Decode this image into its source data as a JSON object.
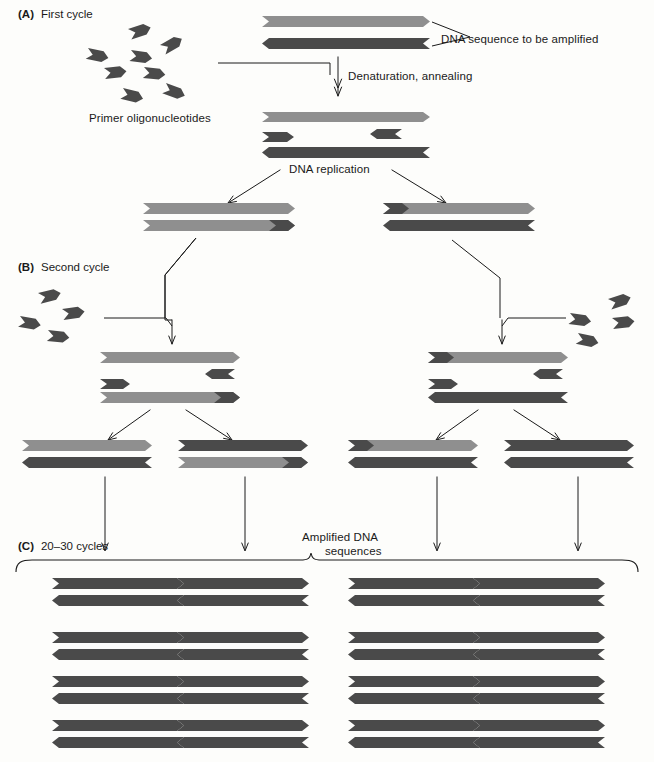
{
  "figure": {
    "type": "diagram"
  },
  "sections": [
    {
      "id": "A",
      "tag": "(A)",
      "label": "First cycle",
      "x": 18,
      "y": 8
    },
    {
      "id": "B",
      "tag": "(B)",
      "label": "Second cycle",
      "x": 18,
      "y": 261
    },
    {
      "id": "C",
      "tag": "(C)",
      "label": "20–30 cycles",
      "x": 18,
      "y": 540
    }
  ],
  "annotations": [
    {
      "name": "dna-sequence-callout",
      "text": "DNA sequence to be amplified",
      "x": 441,
      "y": 33,
      "align": "left"
    },
    {
      "name": "denaturation-annealing-label",
      "text": "Denaturation, annealing",
      "x": 348,
      "y": 70,
      "align": "left"
    },
    {
      "name": "primer-oligonucleotides-label",
      "text": "Primer oligonucleotides",
      "x": 89,
      "y": 112,
      "align": "left"
    },
    {
      "name": "dna-replication-label",
      "text": "DNA replication",
      "x": 289,
      "y": 163,
      "align": "left"
    },
    {
      "name": "amplified-dna-label-line1",
      "text": "Amplified DNA",
      "x": 302,
      "y": 531,
      "align": "left"
    },
    {
      "name": "amplified-dna-label-line2",
      "text": "sequences",
      "x": 325,
      "y": 544,
      "align": "left"
    }
  ],
  "colors": {
    "strand_light": "#8f8f8f",
    "strand_dark": "#4a4a4a",
    "strand_mid": "#9a9a9a",
    "primer": "#4a4a4a",
    "line": "#1a1a1a",
    "text": "#1a1a1a",
    "background": "#fdfdfb"
  },
  "legend_meaning": {
    "light_gray_strand": "original / newly synthesized template strand (sense)",
    "dark_gray_strand": "complementary strand",
    "small_chevron": "primer oligonucleotide"
  },
  "strands": {
    "A_template_top": {
      "x": 262,
      "y": 16,
      "w": 168,
      "h": 11,
      "dir": "right",
      "fill": "light"
    },
    "A_template_bottom": {
      "x": 262,
      "y": 38,
      "w": 168,
      "h": 11,
      "dir": "left",
      "fill": "dark"
    },
    "A_denat_top": {
      "x": 262,
      "y": 112,
      "w": 168,
      "h": 10,
      "dir": "right",
      "fill": "light"
    },
    "A_denat_primer_r": {
      "x": 370,
      "y": 129,
      "w": 32,
      "h": 10,
      "dir": "left",
      "fill": "dark"
    },
    "A_denat_primer_l": {
      "x": 262,
      "y": 132,
      "w": 32,
      "h": 10,
      "dir": "right",
      "fill": "dark"
    },
    "A_denat_bottom": {
      "x": 262,
      "y": 147,
      "w": 168,
      "h": 11,
      "dir": "left",
      "fill": "dark"
    },
    "A_out_L_top": {
      "x": 143,
      "y": 203,
      "w": 152,
      "h": 11,
      "dir": "right",
      "fill": "light"
    },
    "A_out_L_bottom": {
      "x": 143,
      "y": 220,
      "w": 152,
      "h": 11,
      "dir": "right",
      "fill": "light",
      "primer_at": "right"
    },
    "A_out_R_top": {
      "x": 383,
      "y": 203,
      "w": 152,
      "h": 11,
      "dir": "right",
      "fill": "light",
      "primer_at": "left"
    },
    "A_out_R_bottom": {
      "x": 383,
      "y": 220,
      "w": 152,
      "h": 11,
      "dir": "left",
      "fill": "dark"
    },
    "B_mid_L_top": {
      "x": 100,
      "y": 352,
      "w": 140,
      "h": 11,
      "dir": "right",
      "fill": "light"
    },
    "B_mid_L_primer_r": {
      "x": 205,
      "y": 369,
      "w": 30,
      "h": 10,
      "dir": "left",
      "fill": "dark"
    },
    "B_mid_L_primer_l": {
      "x": 100,
      "y": 379,
      "w": 30,
      "h": 10,
      "dir": "right",
      "fill": "dark"
    },
    "B_mid_L_bottom": {
      "x": 100,
      "y": 392,
      "w": 140,
      "h": 11,
      "dir": "right",
      "fill": "light",
      "primer_at": "right"
    },
    "B_mid_R_top": {
      "x": 428,
      "y": 352,
      "w": 140,
      "h": 11,
      "dir": "right",
      "fill": "light",
      "primer_at": "left"
    },
    "B_mid_R_primer_r": {
      "x": 533,
      "y": 369,
      "w": 30,
      "h": 10,
      "dir": "left",
      "fill": "dark"
    },
    "B_mid_R_primer_l": {
      "x": 428,
      "y": 379,
      "w": 30,
      "h": 10,
      "dir": "right",
      "fill": "dark"
    },
    "B_mid_R_bottom": {
      "x": 428,
      "y": 392,
      "w": 140,
      "h": 11,
      "dir": "left",
      "fill": "dark"
    }
  },
  "b_output_duplexes": [
    {
      "name": "duplex-b-1",
      "x": 22,
      "w": 130,
      "top_fill": "light",
      "bottom_fill": "dark",
      "top_primer": "none",
      "bottom_primer": "none"
    },
    {
      "name": "duplex-b-2",
      "x": 178,
      "w": 130,
      "top_fill": "dark",
      "bottom_fill": "light",
      "top_primer": "none",
      "bottom_primer": "right"
    },
    {
      "name": "duplex-b-3",
      "x": 348,
      "w": 130,
      "top_fill": "light",
      "bottom_fill": "dark",
      "top_primer": "left",
      "bottom_primer": "none"
    },
    {
      "name": "duplex-b-4",
      "x": 504,
      "w": 130,
      "top_fill": "dark",
      "bottom_fill": "dark",
      "top_primer": "none",
      "bottom_primer": "none"
    }
  ],
  "c_grid": {
    "rows": 4,
    "cols": 4,
    "col_x": [
      52,
      418,
      846,
      1208
    ],
    "duplex_width": 132,
    "row_y": [
      580,
      634,
      678,
      722
    ],
    "fill": "dark",
    "columns_x": [
      52,
      418,
      846,
      1208
    ]
  },
  "c_duplex_columns": [
    52,
    177,
    348,
    473
  ],
  "c_duplex_rows": [
    578,
    632,
    676,
    720
  ],
  "primers_left_A": [
    {
      "x": 128,
      "y": 29,
      "rot": -18
    },
    {
      "x": 88,
      "y": 48,
      "rot": 12
    },
    {
      "x": 131,
      "y": 50,
      "rot": 8
    },
    {
      "x": 160,
      "y": 45,
      "rot": -30
    },
    {
      "x": 104,
      "y": 68,
      "rot": -6
    },
    {
      "x": 144,
      "y": 67,
      "rot": 6
    },
    {
      "x": 123,
      "y": 88,
      "rot": 14
    },
    {
      "x": 166,
      "y": 83,
      "rot": 20
    }
  ],
  "primers_left_B": [
    {
      "x": 38,
      "y": 293,
      "rot": -14
    },
    {
      "x": 20,
      "y": 316,
      "rot": 10
    },
    {
      "x": 62,
      "y": 309,
      "rot": -8
    },
    {
      "x": 48,
      "y": 330,
      "rot": 6
    }
  ],
  "primers_right_B": [
    {
      "x": 608,
      "y": 299,
      "rot": -18
    },
    {
      "x": 570,
      "y": 313,
      "rot": 8
    },
    {
      "x": 612,
      "y": 318,
      "rot": -6
    },
    {
      "x": 578,
      "y": 333,
      "rot": 12
    }
  ]
}
